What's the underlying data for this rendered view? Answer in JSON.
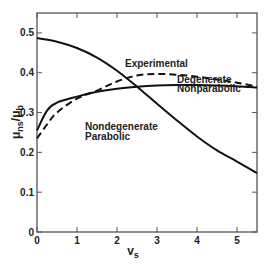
{
  "chart_data": {
    "type": "line",
    "title": "",
    "xlabel": "v_s",
    "ylabel": "μ_ns/μ_b",
    "xlim": [
      0,
      5.5
    ],
    "ylim": [
      0,
      0.55
    ],
    "xticks": [
      0,
      1,
      2,
      3,
      4,
      5
    ],
    "yticks": [
      0,
      0.1,
      0.2,
      0.3,
      0.4,
      0.5
    ],
    "xtick_labels": [
      "0",
      "1",
      "2",
      "3",
      "4",
      "5"
    ],
    "ytick_labels": [
      "0",
      "0.1",
      "0.2",
      "0.3",
      "0.4",
      "0.5"
    ],
    "grid": false,
    "legend": "inline annotations",
    "series": [
      {
        "name": "Nondegenerate Parabolic",
        "style": "solid",
        "x": [
          0,
          0.5,
          1,
          1.5,
          2,
          2.5,
          3,
          3.5,
          4,
          4.5,
          5,
          5.5
        ],
        "y": [
          0.487,
          0.478,
          0.462,
          0.438,
          0.405,
          0.365,
          0.322,
          0.28,
          0.24,
          0.205,
          0.177,
          0.148
        ]
      },
      {
        "name": "Experimental",
        "style": "dashed",
        "x": [
          0,
          0.25,
          0.5,
          1,
          1.5,
          2,
          2.5,
          3,
          3.5,
          4,
          4.5,
          5,
          5.5
        ],
        "y": [
          0.235,
          0.27,
          0.3,
          0.335,
          0.355,
          0.378,
          0.393,
          0.397,
          0.395,
          0.39,
          0.383,
          0.375,
          0.365
        ]
      },
      {
        "name": "Degenerate Nonparabolic",
        "style": "solid",
        "x": [
          0,
          0.25,
          0.5,
          1,
          1.5,
          2,
          2.5,
          3,
          3.5,
          4,
          4.5,
          5,
          5.5
        ],
        "y": [
          0.255,
          0.305,
          0.325,
          0.34,
          0.352,
          0.36,
          0.365,
          0.368,
          0.369,
          0.369,
          0.368,
          0.366,
          0.363
        ]
      }
    ],
    "annotations": [
      {
        "text": "Experimental",
        "x": 2.2,
        "y": 0.415
      },
      {
        "text": "Degenerate",
        "x": 3.5,
        "y": 0.375
      },
      {
        "text": "Nonparabolic",
        "x": 3.5,
        "y": 0.352
      },
      {
        "text": "Nondegenerate",
        "x": 1.2,
        "y": 0.255
      },
      {
        "text": "Parabolic",
        "x": 1.2,
        "y": 0.232
      }
    ]
  }
}
